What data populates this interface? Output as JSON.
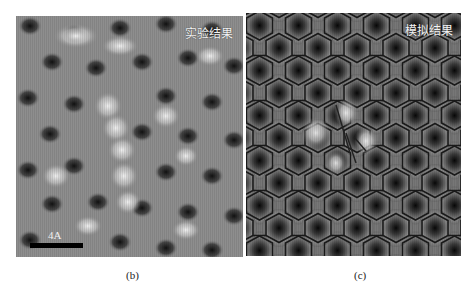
{
  "figure": {
    "panels": [
      {
        "id": "b",
        "title": "实验结果",
        "scale_bar_label": "4A",
        "caption": "(b)"
      },
      {
        "id": "c",
        "title": "模拟结果",
        "caption": "(c)"
      }
    ],
    "colors": {
      "background": "#ffffff",
      "image_text": "#f4f4f4",
      "scale_bar": "#000000",
      "caption_text": "#222222"
    }
  }
}
